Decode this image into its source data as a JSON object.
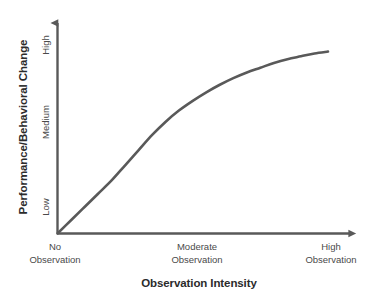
{
  "chart_data": {
    "type": "line",
    "title": "",
    "subtitle": "",
    "xlabel": "Observation Intensity",
    "ylabel": "Performance/Behavioral Change",
    "x_tick_labels": [
      {
        "line1": "No",
        "line2": "Observation"
      },
      {
        "line1": "Moderate",
        "line2": "Observation"
      },
      {
        "line1": "High",
        "line2": "Observation"
      }
    ],
    "y_tick_labels": [
      "Low",
      "Medium",
      "High"
    ],
    "xlim": [
      0,
      1
    ],
    "ylim": [
      0,
      1
    ],
    "grid": false,
    "legend": null,
    "annotations": [],
    "series": [
      {
        "name": "Performance vs Observation Intensity",
        "color": "#595959",
        "line_width": 2.6,
        "points": [
          {
            "x": 0.0,
            "y": 0.0
          },
          {
            "x": 0.05,
            "y": 0.07
          },
          {
            "x": 0.1,
            "y": 0.14
          },
          {
            "x": 0.15,
            "y": 0.21
          },
          {
            "x": 0.2,
            "y": 0.28
          },
          {
            "x": 0.25,
            "y": 0.36
          },
          {
            "x": 0.3,
            "y": 0.44
          },
          {
            "x": 0.35,
            "y": 0.52
          },
          {
            "x": 0.4,
            "y": 0.59
          },
          {
            "x": 0.45,
            "y": 0.65
          },
          {
            "x": 0.5,
            "y": 0.7
          },
          {
            "x": 0.55,
            "y": 0.745
          },
          {
            "x": 0.6,
            "y": 0.785
          },
          {
            "x": 0.65,
            "y": 0.82
          },
          {
            "x": 0.7,
            "y": 0.85
          },
          {
            "x": 0.75,
            "y": 0.875
          },
          {
            "x": 0.8,
            "y": 0.9
          },
          {
            "x": 0.85,
            "y": 0.92
          },
          {
            "x": 0.9,
            "y": 0.935
          },
          {
            "x": 0.95,
            "y": 0.95
          },
          {
            "x": 1.0,
            "y": 0.96
          }
        ]
      }
    ]
  },
  "axes": {
    "x_axis_color": "#595959",
    "y_axis_color": "#595959",
    "arrow_heads": true
  },
  "colors": {
    "curve": "#595959",
    "axis": "#595959",
    "title_text": "#2b2b2b",
    "tick_text": "#4a4a4a",
    "background": "#ffffff"
  }
}
